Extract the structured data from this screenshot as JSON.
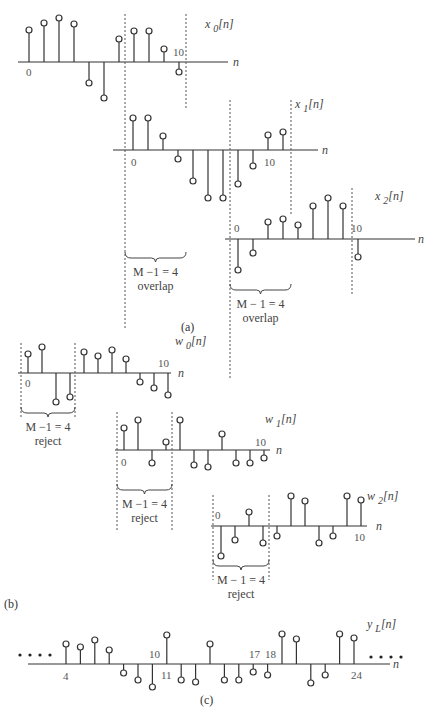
{
  "figure": {
    "panels": [
      {
        "id": "a",
        "caption": "(a)"
      },
      {
        "id": "b",
        "caption": "(b)"
      },
      {
        "id": "c",
        "caption": "(c)"
      }
    ]
  },
  "chart_data": [
    {
      "type": "stem",
      "panel": "a",
      "name": "x0[n]",
      "label": "x0[n]",
      "axis_label": "n",
      "tick_labels": [
        "0",
        "10"
      ],
      "n": [
        0,
        1,
        2,
        3,
        4,
        5,
        6,
        7,
        8,
        9,
        10
      ],
      "values": [
        32,
        39,
        44,
        38,
        -21,
        -36,
        23,
        31,
        31,
        13,
        -10
      ],
      "overlap_region": [
        7,
        10
      ]
    },
    {
      "type": "stem",
      "panel": "a",
      "name": "x1[n]",
      "label": "x1[n]",
      "axis_label": "n",
      "tick_labels": [
        "0",
        "10"
      ],
      "n": [
        0,
        1,
        2,
        3,
        4,
        5,
        6,
        7,
        8,
        9,
        10,
        11
      ],
      "values": [
        32,
        32,
        14,
        -9,
        -31,
        -48,
        -48,
        -34,
        -16,
        15,
        18
      ],
      "overlap_region": [
        0,
        3
      ],
      "annotation": {
        "text": "M −1 = 4",
        "sub": "overlap"
      }
    },
    {
      "type": "stem",
      "panel": "a",
      "name": "x2[n]",
      "label": "x2[n]",
      "axis_label": "n",
      "tick_labels": [
        "0",
        "10"
      ],
      "n": [
        0,
        1,
        2,
        3,
        4,
        5,
        6,
        7,
        8
      ],
      "values": [
        -31,
        -14,
        17,
        20,
        14,
        33,
        41,
        33,
        -18
      ],
      "overlap_region": [
        0,
        3
      ],
      "annotation": {
        "text": "M  − 1 = 4",
        "sub": "overlap"
      }
    },
    {
      "type": "stem",
      "panel": "b",
      "name": "w0[n]",
      "label": "w0[n]",
      "axis_label": "n",
      "tick_labels": [
        "0",
        "10"
      ],
      "n": [
        0,
        1,
        2,
        3,
        4,
        5,
        6,
        7,
        8,
        9,
        10
      ],
      "values": [
        19,
        26,
        -29,
        -24,
        21,
        17,
        23,
        14,
        -9,
        -15,
        -22
      ],
      "reject_region": [
        0,
        3
      ],
      "annotation": {
        "text": "M −1 = 4",
        "sub": "reject"
      }
    },
    {
      "type": "stem",
      "panel": "b",
      "name": "w1[n]",
      "label": "w1[n]",
      "axis_label": "n",
      "tick_labels": [
        "0",
        "10"
      ],
      "n": [
        0,
        1,
        2,
        3,
        4,
        5,
        6,
        7,
        8,
        9,
        10
      ],
      "values": [
        22,
        30,
        -13,
        8,
        30,
        -15,
        -17,
        16,
        -13,
        -13,
        -8
      ],
      "reject_region": [
        0,
        3
      ],
      "annotation": {
        "text": "M −1 = 4",
        "sub": "reject"
      }
    },
    {
      "type": "stem",
      "panel": "b",
      "name": "w2[n]",
      "label": "w2[n]",
      "axis_label": "n",
      "tick_labels": [
        "0",
        "10"
      ],
      "n": [
        0,
        1,
        2,
        3,
        4,
        5,
        6,
        7,
        8,
        9,
        10
      ],
      "values": [
        -30,
        -14,
        14,
        -17,
        -10,
        30,
        25,
        -17,
        -10,
        30,
        26
      ],
      "reject_region": [
        0,
        3
      ],
      "annotation": {
        "text": "M  − 1 = 4",
        "sub": "reject"
      }
    },
    {
      "type": "stem",
      "panel": "c",
      "name": "yL[n]",
      "label": "yL[n]",
      "axis_label": "n",
      "tick_labels": [
        "4",
        "10",
        "11",
        "17",
        "18",
        "24"
      ],
      "n": [
        4,
        5,
        6,
        7,
        8,
        9,
        10,
        11,
        12,
        13,
        14,
        15,
        16,
        17,
        18,
        19,
        20,
        21,
        22,
        23,
        24
      ],
      "values": [
        20,
        17,
        24,
        14,
        -9,
        -16,
        -23,
        29,
        -16,
        -18,
        20,
        -16,
        -16,
        -8,
        -11,
        30,
        25,
        -19,
        -11,
        30,
        26
      ],
      "ellipsis": "• • • •"
    }
  ]
}
